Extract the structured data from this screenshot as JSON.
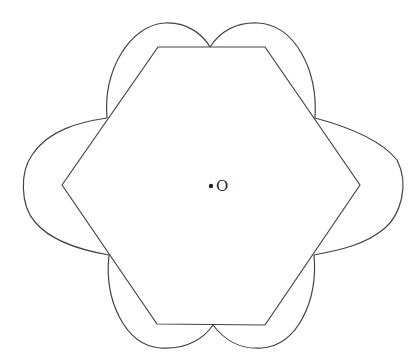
{
  "diagram": {
    "center_label": "O",
    "colors": {
      "stroke": "#444444",
      "background": "#ffffff",
      "text": "#222222"
    },
    "hexagon_vertices": [
      [
        158,
        47
      ],
      [
        265,
        47
      ],
      [
        360,
        185
      ],
      [
        265,
        325
      ],
      [
        157,
        324
      ],
      [
        62,
        185
      ]
    ],
    "arc_points": [
      [
        210,
        47
      ],
      [
        315,
        118
      ],
      [
        314,
        255
      ],
      [
        213,
        325
      ],
      [
        109,
        255
      ],
      [
        107,
        118
      ]
    ]
  }
}
